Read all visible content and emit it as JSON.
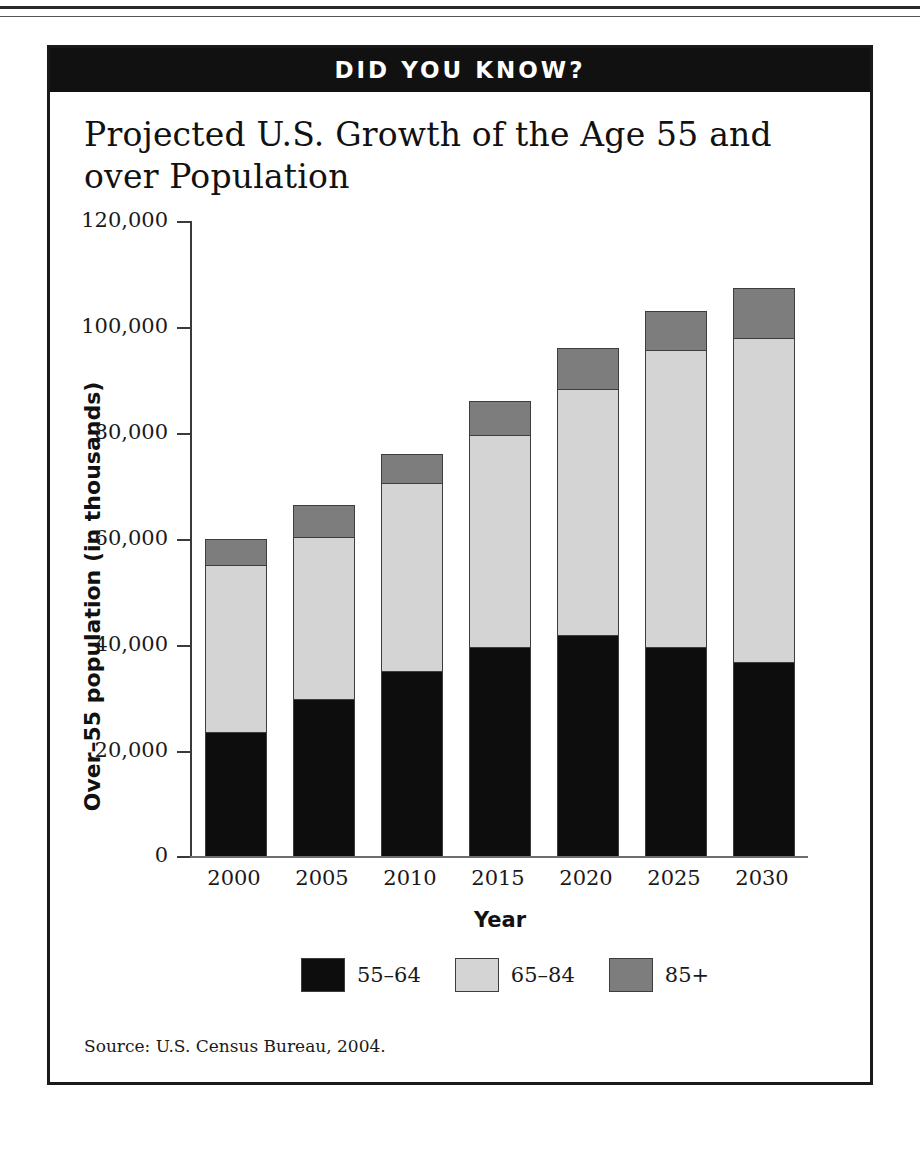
{
  "banner": {
    "label": "DID YOU KNOW?"
  },
  "title": "Projected U.S. Growth of the Age 55 and over Population",
  "source": "Source: U.S. Census Bureau, 2004.",
  "colors": {
    "series_55_64": "#0d0d0d",
    "series_65_84": "#d4d4d4",
    "series_85_plus": "#7d7d7d",
    "banner_bg": "#111111",
    "frame": "#1a1a1a"
  },
  "axis": {
    "y_title": "Over–55 population (in thousands)",
    "x_title": "Year",
    "y_ticks": [
      "0",
      "20,000",
      "40,000",
      "60,000",
      "80,000",
      "100,000",
      "120,000"
    ],
    "x_ticks": [
      "2000",
      "2005",
      "2010",
      "2015",
      "2020",
      "2025",
      "2030"
    ]
  },
  "legend": [
    {
      "label": "55–64",
      "color": "#0d0d0d"
    },
    {
      "label": "65–84",
      "color": "#d4d4d4"
    },
    {
      "label": "85+",
      "color": "#7d7d7d"
    }
  ],
  "chart_data": {
    "type": "bar",
    "stacked": true,
    "title": "Projected U.S. Growth of the Age 55 and over Population",
    "xlabel": "Year",
    "ylabel": "Over–55 population (in thousands)",
    "ylim": [
      0,
      120000
    ],
    "ytick_values": [
      0,
      20000,
      40000,
      60000,
      80000,
      100000,
      120000
    ],
    "grid": false,
    "legend_position": "bottom",
    "categories": [
      "2000",
      "2005",
      "2010",
      "2015",
      "2020",
      "2025",
      "2030"
    ],
    "series": [
      {
        "name": "55–64",
        "color": "#0d0d0d",
        "values": [
          23500,
          29700,
          35000,
          39500,
          41800,
          39600,
          36800
        ]
      },
      {
        "name": "65–84",
        "color": "#d4d4d4",
        "values": [
          31500,
          30600,
          35500,
          40200,
          46500,
          56200,
          61200
        ]
      },
      {
        "name": "85+",
        "color": "#7d7d7d",
        "values": [
          5000,
          6200,
          5500,
          6300,
          7700,
          7200,
          9500
        ]
      }
    ],
    "totals": [
      60000,
      66500,
      76000,
      86000,
      96000,
      103000,
      107500
    ],
    "annotations": [
      "Source: U.S. Census Bureau, 2004."
    ]
  }
}
